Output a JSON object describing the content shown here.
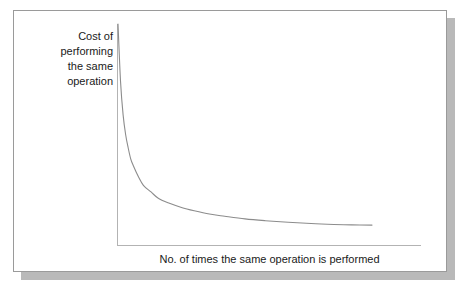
{
  "figure": {
    "background_color": "#ffffff",
    "frame_border_color": "#9a9a9a",
    "shadow_color": "#b9b9b9"
  },
  "chart_data": {
    "type": "line",
    "title": "",
    "subtitle": "",
    "xlabel": "No. of times the same operation is performed",
    "ylabel": "Cost of\nperforming\nthe same\noperation",
    "ylabel_lines": [
      "Cost of",
      "performing",
      "the same",
      "operation"
    ],
    "series": [
      {
        "name": "Cost per operation",
        "x": [
          0,
          1,
          2,
          3,
          4,
          5,
          6,
          8,
          10,
          13,
          16,
          20,
          25,
          30,
          36,
          42,
          50,
          58,
          67,
          76,
          85,
          92,
          100
        ],
        "y": [
          100,
          74,
          59,
          50,
          44,
          39,
          36,
          31,
          27,
          24,
          21,
          19,
          17,
          15.5,
          14,
          13,
          11.8,
          11,
          10.3,
          9.7,
          9.3,
          9.1,
          9.0
        ]
      }
    ],
    "xlim": [
      0,
      100
    ],
    "ylim": [
      0,
      100
    ],
    "x_tick_labels": [],
    "y_tick_labels": [],
    "grid": false,
    "legend": false,
    "legend_position": "none",
    "curve_color": "#8c8c8c",
    "axis_color": "#b3b3b3",
    "annotation": "Cost decreases as the same operation is repeated more times (learning curve)."
  }
}
